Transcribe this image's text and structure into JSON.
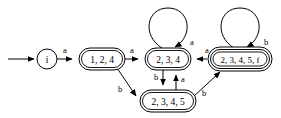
{
  "diagram": {
    "type": "finite-state-machine",
    "title": "",
    "states": [
      {
        "id": "i",
        "label": "i",
        "shape": "circle",
        "accepting": false,
        "start": true,
        "cx": 47,
        "cy": 59,
        "rx": 10,
        "ry": 10
      },
      {
        "id": "s124",
        "label": "1, 2, 4",
        "shape": "rounded-rect",
        "accepting": false,
        "start": false,
        "cx": 102,
        "cy": 59,
        "rx": 23,
        "ry": 11
      },
      {
        "id": "s234",
        "label": "2, 3, 4",
        "shape": "rounded-rect",
        "accepting": false,
        "start": false,
        "cx": 168,
        "cy": 59,
        "rx": 23,
        "ry": 11
      },
      {
        "id": "s2345",
        "label": "2, 3, 4, 5",
        "shape": "rounded-rect",
        "accepting": false,
        "start": false,
        "cx": 168,
        "cy": 101,
        "rx": 28,
        "ry": 11
      },
      {
        "id": "s2345f",
        "label": "2, 3, 4, 5, f",
        "shape": "rounded-rect-double",
        "accepting": true,
        "start": false,
        "cx": 240,
        "cy": 59,
        "rx": 32,
        "ry": 11
      }
    ],
    "transitions": [
      {
        "id": "t-start",
        "from": "",
        "to": "i",
        "label": "",
        "kind": "start-arrow"
      },
      {
        "id": "t-i-124",
        "from": "i",
        "to": "s124",
        "label": "a",
        "kind": "straight"
      },
      {
        "id": "t-124-234",
        "from": "s124",
        "to": "s234",
        "label": "a",
        "kind": "straight"
      },
      {
        "id": "t-124-2345",
        "from": "s124",
        "to": "s2345",
        "label": "b",
        "kind": "diagonal"
      },
      {
        "id": "t-234-self",
        "from": "s234",
        "to": "s234",
        "label": "a",
        "kind": "self-loop"
      },
      {
        "id": "t-234-2345",
        "from": "s234",
        "to": "s2345",
        "label": "b",
        "kind": "vertical-down"
      },
      {
        "id": "t-2345-234",
        "from": "s2345",
        "to": "s234",
        "label": "a",
        "kind": "vertical-up"
      },
      {
        "id": "t-2345-2345f",
        "from": "s2345",
        "to": "s2345f",
        "label": "b",
        "kind": "diagonal"
      },
      {
        "id": "t-2345f-234",
        "from": "s2345f",
        "to": "s234",
        "label": "a",
        "kind": "straight"
      },
      {
        "id": "t-2345f-self",
        "from": "s2345f",
        "to": "s2345f",
        "label": "b",
        "kind": "self-loop"
      }
    ],
    "alphabet": [
      "a",
      "b"
    ],
    "colors": {
      "stroke": "#000000",
      "fill": "#ffffff",
      "background": "#ffffff"
    }
  }
}
